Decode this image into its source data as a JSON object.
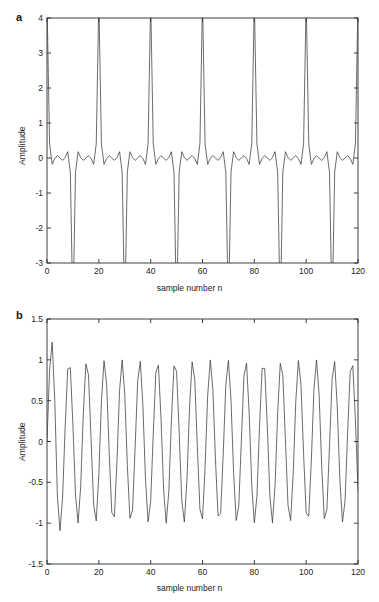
{
  "figure": {
    "background": "#ffffff",
    "line_color": "#3a3a3a",
    "axis_color": "#2b2b2b",
    "panels": [
      {
        "letter": "a",
        "xlabel": "sample number n",
        "ylabel": "Amplitude"
      },
      {
        "letter": "b",
        "xlabel": "sample number n",
        "ylabel": "Amplitude"
      }
    ]
  },
  "chart_data": [
    {
      "type": "line",
      "panel": "a",
      "title": "",
      "xlabel": "sample number n",
      "ylabel": "Amplitude",
      "xlim": [
        0,
        120
      ],
      "ylim": [
        -3,
        4
      ],
      "xticks": [
        0,
        20,
        40,
        60,
        80,
        100,
        120
      ],
      "xticklabels": [
        "0",
        "20",
        "40",
        "60",
        "80",
        "100",
        "120"
      ],
      "yticks": [
        -3,
        -2,
        -1,
        0,
        1,
        2,
        3,
        4
      ],
      "yticklabels": [
        "-3",
        "-2",
        "-1",
        "0",
        "1",
        "2",
        "3",
        "4"
      ],
      "grid": false,
      "legend": false,
      "description": "Sum of sinusoids, periodic with period 20 samples; tall spikes reaching about 3.5 at n = 20, 40, 60, 80, 100; minima near -2.9",
      "model": {
        "kind": "sum_of_sinusoids",
        "n_start": 0,
        "n_end": 120,
        "components": [
          {
            "amplitude": 1.0,
            "frequency_cycles_per_sample": 0.05,
            "phase_rad": 0.0
          },
          {
            "amplitude": 1.0,
            "frequency_cycles_per_sample": 0.15,
            "phase_rad": 0.0
          },
          {
            "amplitude": 1.0,
            "frequency_cycles_per_sample": 0.25,
            "phase_rad": 0.0
          },
          {
            "amplitude": 0.8,
            "frequency_cycles_per_sample": 0.35,
            "phase_rad": 0.0
          },
          {
            "amplitude": 0.7,
            "frequency_cycles_per_sample": 0.45,
            "phase_rad": 0.0
          }
        ],
        "peak_max": 3.5,
        "peak_min": -2.9
      }
    },
    {
      "type": "line",
      "panel": "b",
      "title": "",
      "xlabel": "sample number n",
      "ylabel": "Amplitude",
      "xlim": [
        0,
        120
      ],
      "ylim": [
        -1.5,
        1.5
      ],
      "xticks": [
        0,
        20,
        40,
        60,
        80,
        100,
        120
      ],
      "xticklabels": [
        "0",
        "20",
        "40",
        "60",
        "80",
        "100",
        "120"
      ],
      "yticks": [
        -1.5,
        -1,
        -0.5,
        0,
        0.5,
        1,
        1.5
      ],
      "yticklabels": [
        "-1.5",
        "-1",
        "-0.5",
        "0",
        "0.5",
        "1",
        "1.5"
      ],
      "grid": false,
      "legend": false,
      "description": "Single sinusoid of unit amplitude, about 17.6 cycles across 120 samples (period about 6.8), with a transient overshoot to about 1.37 near n = 3 and undershoot to about -1.12 near n = 5",
      "model": {
        "kind": "sinusoid",
        "n_start": 0,
        "n_end": 120,
        "amplitude": 1.0,
        "frequency_cycles_per_sample": 0.1467,
        "phase_rad": 0.0,
        "transient_overshoot": 1.37,
        "transient_undershoot": -1.12
      }
    }
  ]
}
